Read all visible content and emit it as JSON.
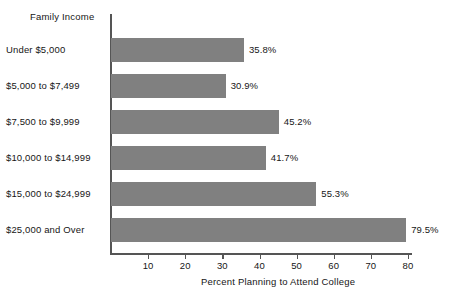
{
  "chart_data": {
    "type": "bar",
    "orientation": "horizontal",
    "title": "",
    "category_axis_title": "Family Income",
    "categories": [
      "Under $5,000",
      "$5,000 to $7,499",
      "$7,500 to $9,999",
      "$10,000 to $14,999",
      "$15,000 to $24,999",
      "$25,000 and Over"
    ],
    "values": [
      35.8,
      30.9,
      45.2,
      41.7,
      55.3,
      79.5
    ],
    "value_labels": [
      "35.8%",
      "30.9%",
      "45.2%",
      "41.7%",
      "55.3%",
      "79.5%"
    ],
    "xlabel": "Percent Planning to Attend College",
    "ylabel": "Family Income",
    "xlim": [
      0,
      80
    ],
    "xticks": [
      10,
      20,
      30,
      40,
      50,
      60,
      70,
      80
    ],
    "xtick_labels": [
      "10",
      "20",
      "30",
      "40",
      "50",
      "60",
      "70",
      "80"
    ],
    "grid": false,
    "legend": null,
    "colors": {
      "bar_fill": "#808080",
      "axis": "#555555",
      "text": "#161616",
      "background": "#ffffff"
    }
  }
}
